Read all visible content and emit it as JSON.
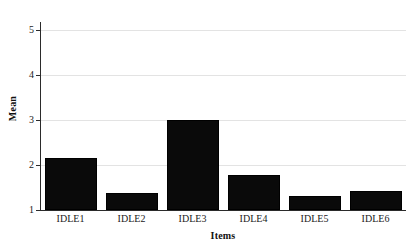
{
  "chart_data": {
    "type": "bar",
    "title": "",
    "xlabel": "Items",
    "ylabel": "Mean",
    "categories": [
      "IDLE1",
      "IDLE2",
      "IDLE3",
      "IDLE4",
      "IDLE5",
      "IDLE6"
    ],
    "values": [
      2.15,
      1.37,
      3.0,
      1.78,
      1.32,
      1.42
    ],
    "ylim": [
      1,
      5
    ],
    "yticks": [
      1,
      2,
      3,
      4,
      5
    ],
    "ytick_labels": [
      "1",
      "2",
      "3",
      "4",
      "5"
    ],
    "grid": true,
    "grid_axis": "y",
    "legend": false,
    "legend_position": "none",
    "series": [
      {
        "name": "Mean",
        "color": "#0a0a0a",
        "values": [
          2.15,
          1.37,
          3.0,
          1.78,
          1.32,
          1.42
        ]
      }
    ],
    "colors": {
      "bar": "#0a0a0a",
      "grid": "#e3e3e3",
      "axis": "#2b2b2b",
      "background": "#ffffff",
      "text": "#1a1a1a"
    }
  },
  "axes": {
    "x_title": "Items",
    "y_title": "Mean"
  },
  "y_ticks": [
    {
      "label": "5",
      "value": 5
    },
    {
      "label": "4",
      "value": 4
    },
    {
      "label": "3",
      "value": 3
    },
    {
      "label": "2",
      "value": 2
    },
    {
      "label": "1",
      "value": 1
    }
  ],
  "bars": [
    {
      "label": "IDLE1",
      "value": 2.15
    },
    {
      "label": "IDLE2",
      "value": 1.37
    },
    {
      "label": "IDLE3",
      "value": 3.0
    },
    {
      "label": "IDLE4",
      "value": 1.78
    },
    {
      "label": "IDLE5",
      "value": 1.32
    },
    {
      "label": "IDLE6",
      "value": 1.42
    }
  ]
}
